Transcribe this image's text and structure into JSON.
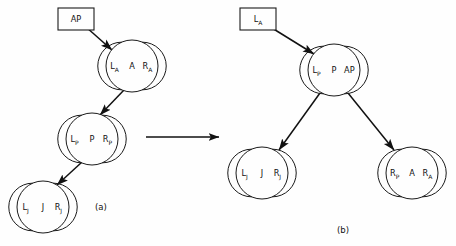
{
  "figure": {
    "background_color": "#fefefe",
    "line_color": "#111111",
    "captions": {
      "left": "(a)",
      "right": "(b)"
    },
    "transform_arrow": {
      "name": "transforms-to",
      "direction": "left-to-right",
      "x1": 146,
      "y1": 137,
      "x2": 219,
      "y2": 137
    }
  },
  "panel_a": {
    "caption": "(a)",
    "box": {
      "label": "AP",
      "x": 58,
      "y": 8,
      "w": 36,
      "h": 22
    },
    "nodes": [
      {
        "id": "a-root",
        "left": "L",
        "left_sub": "A",
        "key": "A",
        "right": "R",
        "right_sub": "A",
        "cx": 132,
        "cy": 66,
        "r": 26
      },
      {
        "id": "a-p",
        "left": "L",
        "left_sub": "P",
        "key": "P",
        "right": "R",
        "right_sub": "P",
        "cx": 92,
        "cy": 139,
        "r": 26
      },
      {
        "id": "a-j",
        "left": "L",
        "left_sub": "J",
        "key": "J",
        "right": "R",
        "right_sub": "J",
        "cx": 43,
        "cy": 207,
        "r": 26
      }
    ],
    "edges": [
      {
        "name": "edge-ap-box-to-root",
        "x1": 86,
        "y1": 27,
        "x2": 112,
        "y2": 50
      },
      {
        "name": "edge-root-to-p",
        "x1": 124,
        "y1": 90,
        "x2": 100,
        "y2": 115
      },
      {
        "name": "edge-p-to-j",
        "x1": 82,
        "y1": 162,
        "x2": 57,
        "y2": 185
      }
    ]
  },
  "panel_b": {
    "caption": "(b)",
    "box": {
      "label": "L",
      "label_sub": "A",
      "x": 240,
      "y": 8,
      "w": 36,
      "h": 22
    },
    "nodes": [
      {
        "id": "b-root",
        "left": "L",
        "left_sub": "P",
        "key": "P",
        "right": "AP",
        "right_sub": "",
        "cx": 334,
        "cy": 70,
        "r": 26
      },
      {
        "id": "b-left",
        "left": "L",
        "left_sub": "J",
        "key": "J",
        "right": "R",
        "right_sub": "J",
        "cx": 262,
        "cy": 173,
        "r": 26
      },
      {
        "id": "b-right",
        "left": "R",
        "left_sub": "P",
        "key": "A",
        "right": "R",
        "right_sub": "A",
        "cx": 412,
        "cy": 173,
        "r": 26
      }
    ],
    "edges": [
      {
        "name": "edge-la-box-to-root",
        "x1": 272,
        "y1": 28,
        "x2": 314,
        "y2": 54
      },
      {
        "name": "edge-root-to-left",
        "x1": 320,
        "y1": 93,
        "x2": 279,
        "y2": 150
      },
      {
        "name": "edge-root-to-right",
        "x1": 348,
        "y1": 93,
        "x2": 394,
        "y2": 150
      }
    ]
  }
}
